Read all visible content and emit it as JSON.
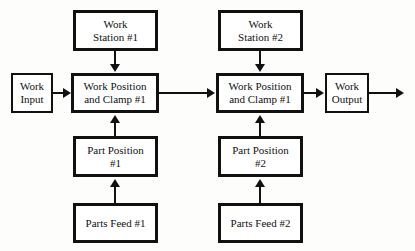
{
  "diagram": {
    "background_color": "#fdfdfc",
    "line_color": "#111111",
    "box_fill": "#ffffff",
    "nodes": {
      "work_input": "Work\nInput",
      "work_station_1": "Work\nStation #1",
      "work_station_2": "Work\nStation #2",
      "work_position_clamp_1": "Work Position\nand Clamp #1",
      "work_position_clamp_2": "Work Position\nand Clamp #1",
      "part_position_1": "Part Position\n#1",
      "part_position_2": "Part Position\n#2",
      "parts_feed_1": "Parts Feed #1",
      "parts_feed_2": "Parts Feed #2",
      "work_output": "Work\nOutput"
    },
    "edges": [
      {
        "name": "input-to-clamp1",
        "from": "work_input",
        "to": "work_position_clamp_1",
        "direction": "right"
      },
      {
        "name": "station1-to-clamp1",
        "from": "work_station_1",
        "to": "work_position_clamp_1",
        "direction": "down"
      },
      {
        "name": "partposition1-to-clamp1",
        "from": "part_position_1",
        "to": "work_position_clamp_1",
        "direction": "up"
      },
      {
        "name": "partsfeed1-to-partposition1",
        "from": "parts_feed_1",
        "to": "part_position_1",
        "direction": "up"
      },
      {
        "name": "clamp1-to-clamp2",
        "from": "work_position_clamp_1",
        "to": "work_position_clamp_2",
        "direction": "right"
      },
      {
        "name": "station2-to-clamp2",
        "from": "work_station_2",
        "to": "work_position_clamp_2",
        "direction": "down"
      },
      {
        "name": "partposition2-to-clamp2",
        "from": "part_position_2",
        "to": "work_position_clamp_2",
        "direction": "up"
      },
      {
        "name": "partsfeed2-to-partposition2",
        "from": "parts_feed_2",
        "to": "part_position_2",
        "direction": "up"
      },
      {
        "name": "clamp2-to-output",
        "from": "work_position_clamp_2",
        "to": "work_output",
        "direction": "right"
      },
      {
        "name": "output-exit",
        "from": "work_output",
        "to": null,
        "direction": "right"
      }
    ]
  }
}
